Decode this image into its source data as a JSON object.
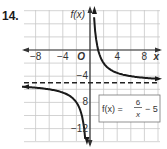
{
  "problem_number": "14.",
  "graph": {
    "y_axis_label": "f(x)",
    "x_axis_label": "x",
    "origin_label": "O",
    "x_tick_labels": [
      "−8",
      "−4",
      "4",
      "8"
    ],
    "y_tick_labels": [
      "−4",
      "8",
      "−12"
    ],
    "equation": {
      "lhs": "f(x) =",
      "numerator": "6",
      "denominator": "x",
      "tail": "− 5"
    }
  },
  "chart_data": {
    "type": "line",
    "title": "",
    "function": "f(x) = 6/x - 5",
    "xlabel": "x",
    "ylabel": "f(x)",
    "xlim": [
      -10,
      10
    ],
    "ylim": [
      -14,
      6
    ],
    "grid": true,
    "grid_step": 2,
    "x_ticks_labeled": [
      -8,
      -4,
      4,
      8
    ],
    "y_ticks_labeled": [
      -4,
      -8,
      -12
    ],
    "asymptotes": {
      "vertical": 0,
      "horizontal": -5
    },
    "series": [
      {
        "name": "branch x>0",
        "x": [
          0.6,
          0.8,
          1,
          1.5,
          2,
          3,
          4,
          6,
          8,
          10
        ],
        "y": [
          5,
          2.5,
          1,
          -1,
          -2,
          -3,
          -3.5,
          -4,
          -4.25,
          -4.4
        ]
      },
      {
        "name": "branch x<0",
        "x": [
          -10,
          -8,
          -6,
          -4,
          -3,
          -2,
          -1.5,
          -1,
          -0.8,
          -0.7
        ],
        "y": [
          -5.6,
          -5.75,
          -6,
          -6.5,
          -7,
          -8,
          -9,
          -11,
          -12.5,
          -13.6
        ]
      }
    ],
    "legend": "f(x) = 6/x − 5"
  }
}
